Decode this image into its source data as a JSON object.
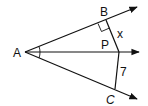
{
  "diagram": {
    "type": "geometry",
    "stroke_color": "#111111",
    "background": "#ffffff",
    "points": {
      "A": {
        "label": "A",
        "x": 25,
        "y": 52
      },
      "B": {
        "label": "B",
        "x": 106,
        "y": 20
      },
      "P": {
        "label": "P",
        "x": 119,
        "y": 52
      },
      "C": {
        "label": "C",
        "x": 115,
        "y": 89
      }
    },
    "rays": [
      {
        "from": "A",
        "through": "B"
      },
      {
        "from": "A",
        "through": "P"
      },
      {
        "from": "A",
        "through": "C"
      }
    ],
    "segments": [
      {
        "from": "P",
        "to": "B",
        "label": "x"
      },
      {
        "from": "P",
        "to": "C",
        "label": "7"
      }
    ],
    "right_angle_at": "B",
    "congruent_angles_at": "A",
    "labels": {
      "A": "A",
      "B": "B",
      "P": "P",
      "C": "C",
      "x": "x",
      "seven": "7"
    }
  }
}
